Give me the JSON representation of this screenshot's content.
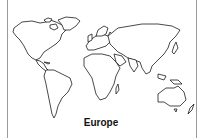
{
  "map": {
    "type": "world-outline",
    "label": "Europe",
    "colors": {
      "outline": "#1a1a1a",
      "background": "#ffffff",
      "frame": "#9a9a9a"
    }
  }
}
